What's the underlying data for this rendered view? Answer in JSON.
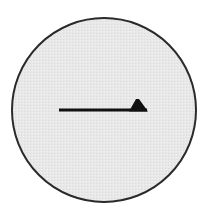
{
  "diagram": {
    "type": "symbol",
    "description": "Circle containing a rightward single-barbed (harpoon) arrow",
    "circle": {
      "cx": 104,
      "cy": 110,
      "r": 92,
      "fill": "#e9e9e9",
      "stroke": "#2a2a2a"
    },
    "arrow": {
      "direction": "right",
      "style": "half-arrowhead-upper",
      "x1": 59,
      "y1": 110,
      "x2": 147,
      "y2": 110,
      "color": "#111111"
    }
  }
}
